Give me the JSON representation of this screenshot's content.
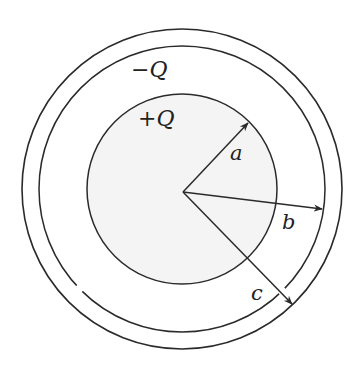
{
  "diagram": {
    "type": "concentric-spherical-capacitor",
    "colors": {
      "stroke": "#2a2a2a",
      "inner_fill": "#f4f4f4",
      "background": "#ffffff"
    },
    "geometry": {
      "center": [
        182,
        189
      ],
      "outer_radius": 160,
      "shell_inner_radius": 143,
      "inner_sphere_radius": 95
    },
    "labels": {
      "outer_charge": "−Q",
      "inner_charge": "+Q",
      "radius_a": "a",
      "radius_b": "b",
      "radius_c": "c"
    },
    "arrows": [
      {
        "name": "a",
        "to": [
          248,
          123
        ]
      },
      {
        "name": "b",
        "to": [
          322,
          209
        ]
      },
      {
        "name": "c",
        "to": [
          292,
          304
        ]
      }
    ]
  }
}
